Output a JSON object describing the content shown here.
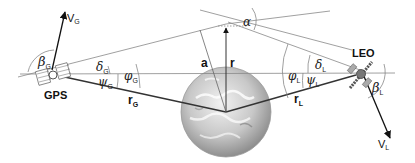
{
  "diagram": {
    "nodes": {
      "gps": {
        "label": "GPS",
        "velocity": "V",
        "velocity_sub": "G",
        "beta": "β",
        "beta_sub": "G"
      },
      "leo": {
        "label": "LEO",
        "velocity": "V",
        "velocity_sub": "L",
        "beta": "β",
        "beta_sub": "L"
      },
      "earth": {
        "label": "Earth"
      }
    },
    "vectors": {
      "r_gps": {
        "symbol": "r",
        "sub": "G"
      },
      "r_leo": {
        "symbol": "r",
        "sub": "L"
      },
      "r": {
        "symbol": "r"
      },
      "a": {
        "symbol": "a"
      }
    },
    "angles": {
      "delta_g": {
        "symbol": "δ",
        "sub": "G"
      },
      "psi_g": {
        "symbol": "ψ",
        "sub": "G"
      },
      "phi_g": {
        "symbol": "φ",
        "sub": "G"
      },
      "delta_l": {
        "symbol": "δ",
        "sub": "L"
      },
      "psi_l": {
        "symbol": "ψ",
        "sub": "L"
      },
      "phi_l": {
        "symbol": "φ",
        "sub": "L"
      },
      "alpha": {
        "symbol": "α"
      }
    },
    "colors": {
      "line": "#555555",
      "thin_line": "#888888",
      "text": "#111111",
      "earth_light": "#e8e8e8",
      "earth_dark": "#9a9a9a"
    }
  }
}
